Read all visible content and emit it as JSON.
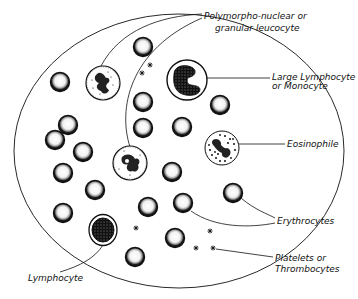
{
  "diagram": {
    "field": {
      "cx": 179,
      "cy": 151,
      "rx": 165,
      "ry": 137
    },
    "labels": {
      "polymorph_line1": "Polymorpho-nuclear  or",
      "polymorph_line2": "granular  leucocyte",
      "monocyte_line1": "Large Lymphocyte",
      "monocyte_line2": "or  Monocyte",
      "eosinophile": "Eosinophile",
      "erythrocytes": "Erythrocytes",
      "platelets_line1": "Platelets  or",
      "platelets_line2": "Thrombocytes",
      "lymphocyte": "Lymphocyte"
    },
    "erythrocytes": [
      {
        "x": 143,
        "y": 47
      },
      {
        "x": 60,
        "y": 82
      },
      {
        "x": 143,
        "y": 102
      },
      {
        "x": 220,
        "y": 105
      },
      {
        "x": 68,
        "y": 125
      },
      {
        "x": 143,
        "y": 128
      },
      {
        "x": 182,
        "y": 127
      },
      {
        "x": 55,
        "y": 140
      },
      {
        "x": 83,
        "y": 152
      },
      {
        "x": 63,
        "y": 173
      },
      {
        "x": 172,
        "y": 172
      },
      {
        "x": 95,
        "y": 190
      },
      {
        "x": 233,
        "y": 193
      },
      {
        "x": 148,
        "y": 207
      },
      {
        "x": 183,
        "y": 203
      },
      {
        "x": 63,
        "y": 213
      },
      {
        "x": 175,
        "y": 238
      },
      {
        "x": 135,
        "y": 257
      }
    ],
    "platelets": [
      {
        "x": 150,
        "y": 65
      },
      {
        "x": 142,
        "y": 73
      },
      {
        "x": 136,
        "y": 228
      },
      {
        "x": 210,
        "y": 231
      },
      {
        "x": 196,
        "y": 248
      },
      {
        "x": 213,
        "y": 248
      }
    ],
    "colors": {
      "ink": "#111111",
      "background": "#ffffff"
    }
  }
}
